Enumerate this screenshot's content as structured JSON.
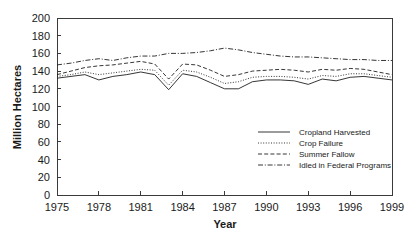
{
  "chart_data": {
    "type": "line",
    "title": "",
    "xlabel": "Year",
    "ylabel": "Million Hectares",
    "xlim": [
      1975,
      1999
    ],
    "ylim": [
      0,
      200
    ],
    "xticks": [
      1975,
      1978,
      1981,
      1984,
      1987,
      1990,
      1993,
      1996,
      1999
    ],
    "yticks": [
      0,
      20,
      40,
      60,
      80,
      100,
      120,
      140,
      160,
      180,
      200
    ],
    "grid": false,
    "legend_position": "inside-lower-right",
    "x": [
      1975,
      1976,
      1977,
      1978,
      1979,
      1980,
      1981,
      1982,
      1983,
      1984,
      1985,
      1986,
      1987,
      1988,
      1989,
      1990,
      1991,
      1992,
      1993,
      1994,
      1995,
      1996,
      1997,
      1998,
      1999
    ],
    "series": [
      {
        "name": "Cropland Harvested",
        "dash": "solid",
        "values": [
          132,
          134,
          136,
          130,
          134,
          136,
          139,
          136,
          119,
          137,
          134,
          127,
          120,
          120,
          128,
          130,
          130,
          129,
          125,
          131,
          129,
          133,
          134,
          132,
          130
        ]
      },
      {
        "name": "Crop Failure",
        "dash": "dotted",
        "values": [
          134,
          136,
          139,
          136,
          138,
          140,
          142,
          141,
          124,
          141,
          139,
          133,
          126,
          128,
          133,
          134,
          134,
          133,
          131,
          135,
          134,
          137,
          137,
          135,
          133
        ]
      },
      {
        "name": "Summer Fallow",
        "dash": "dashed",
        "values": [
          136,
          140,
          144,
          146,
          147,
          149,
          151,
          148,
          131,
          148,
          147,
          141,
          134,
          136,
          140,
          141,
          142,
          141,
          139,
          142,
          141,
          143,
          142,
          139,
          136
        ]
      },
      {
        "name": "Idled in Federal Programs",
        "dash": "dashdot",
        "values": [
          147,
          149,
          152,
          154,
          152,
          155,
          157,
          157,
          160,
          160,
          161,
          163,
          166,
          164,
          161,
          159,
          157,
          156,
          156,
          155,
          154,
          153,
          153,
          152,
          152
        ]
      }
    ]
  },
  "axes": {
    "y_title": "Million Hectares",
    "x_title": "Year",
    "y_tick_labels": [
      "200",
      "180",
      "160",
      "140",
      "120",
      "100",
      "80",
      "60",
      "40",
      "20",
      "0"
    ],
    "x_tick_labels": [
      "1975",
      "1978",
      "1981",
      "1984",
      "1987",
      "1990",
      "1993",
      "1996",
      "1999"
    ]
  },
  "legend": {
    "items": [
      {
        "label": "Cropland Harvested",
        "dash": "solid"
      },
      {
        "label": "Crop Failure",
        "dash": "dotted"
      },
      {
        "label": "Summer Fallow",
        "dash": "dashed"
      },
      {
        "label": "Idled in Federal Programs",
        "dash": "dashdot"
      }
    ]
  },
  "colors": {
    "background": "#ffffff",
    "ink": "#1f1f1f",
    "axis": "#3a3a3a"
  }
}
